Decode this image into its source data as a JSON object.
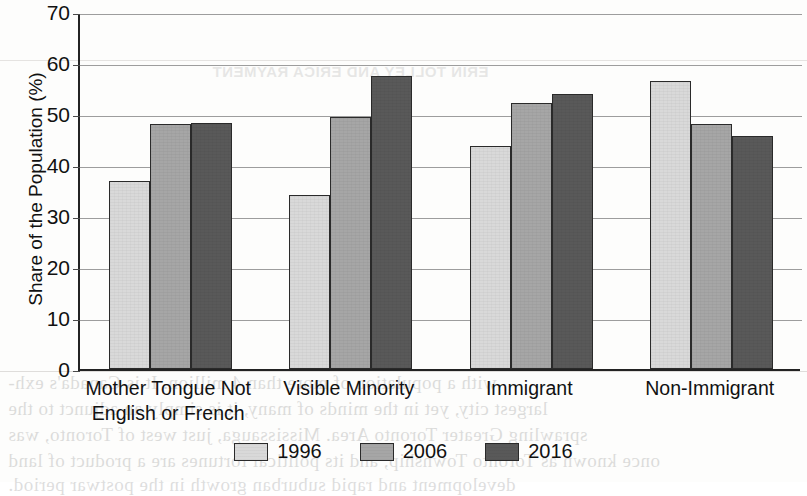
{
  "chart_data": {
    "type": "bar",
    "title": "",
    "subtitle": "",
    "xlabel": "",
    "ylabel": "Share of the Population (%)",
    "ylim": [
      0,
      70
    ],
    "ytick_step": 10,
    "yticks": [
      "70",
      "60",
      "50",
      "40",
      "30",
      "20",
      "10",
      "0"
    ],
    "grid": true,
    "legend_position": "bottom-center",
    "categories": [
      "Mother Tongue Not English or French",
      "Visible Minority",
      "Immigrant",
      "Non-Immigrant"
    ],
    "category_lines": [
      [
        "Mother Tongue Not",
        "English or French"
      ],
      [
        "Visible Minority"
      ],
      [
        "Immigrant"
      ],
      [
        "Non-Immigrant"
      ]
    ],
    "series": [
      {
        "name": "1996",
        "color": "#d9d9d9",
        "values": [
          36.9,
          34.2,
          43.7,
          56.5
        ]
      },
      {
        "name": "2006",
        "color": "#a6a6a6",
        "values": [
          48.0,
          49.4,
          52.1,
          48.1
        ]
      },
      {
        "name": "2016",
        "color": "#595959",
        "values": [
          48.3,
          57.5,
          53.9,
          45.6
        ]
      }
    ]
  },
  "page_artifacts": {
    "header_bleed": "ERIN TOLLEY AND ERICA RAYMENT",
    "body_bleed": [
      "with a population of more than 4 million. It is Canada's exh-",
      "largest city, yet in the minds of many, it is simply an adjunct to the",
      "sprawling Greater Toronto Area. Mississauga, just west of Toronto, was",
      "once known as Toronto Township, and its political fortunes are a product of land",
      "development and rapid suburban growth in the postwar period."
    ]
  }
}
